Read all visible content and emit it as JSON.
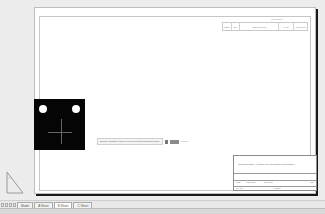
{
  "drawing": {
    "revision_table": {
      "title": "REVISIONS",
      "columns": [
        "ZONE",
        "REV",
        "DESCRIPTION",
        "DATE",
        "APPROVED"
      ]
    },
    "dynamic_input": {
      "prompt": "Specify opposite corner or [Fence/WPolygon/CPolygon]:",
      "field_value": "",
      "coordinate": "5.7717"
    },
    "title_block": {
      "company": "CompanyName - Custom Iso Title Block Presentation",
      "labels": [
        "SIZE",
        "FSCM NO",
        "DWG NO",
        "REV",
        "SCALE",
        "SHEET"
      ]
    }
  },
  "layout_tabs": {
    "items": [
      {
        "label": "Model",
        "active": false
      },
      {
        "label": "A Sheet",
        "active": false
      },
      {
        "label": "B Sheet",
        "active": true
      },
      {
        "label": "C Sheet",
        "active": false
      }
    ]
  },
  "colors": {
    "model_background": "#ececec",
    "paper": "#ffffff",
    "viewport_background": "#050505"
  }
}
